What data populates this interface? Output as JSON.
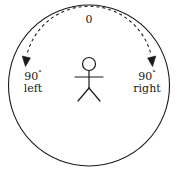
{
  "diagram": {
    "background_color": "#ffffff",
    "stroke_color": "#1a1a1a",
    "outer_circle": {
      "name": "boundary-circle",
      "center_x": 89,
      "center_y": 85.5,
      "radius": 80.5
    },
    "figure": {
      "name": "stick-figure",
      "head_center_x": 89,
      "head_center_y": 64,
      "head_radius": 6.5,
      "body_top_y": 70.5,
      "body_bottom_y": 88,
      "arm_y": 77,
      "arm_left_x": 75,
      "arm_right_x": 103,
      "leg_left_x": 78,
      "leg_right_x": 100,
      "leg_bottom_y": 101
    },
    "arc": {
      "name": "dashed-direction-arc",
      "style": "dashed",
      "dash_pattern": "3 3",
      "radius": 64,
      "has_arrowheads_both_ends": true
    },
    "labels": {
      "zero": "0",
      "left": {
        "angle": "90",
        "degree_symbol": "°",
        "direction": "left"
      },
      "right": {
        "angle": "90",
        "degree_symbol": "°",
        "direction": "right"
      }
    }
  }
}
